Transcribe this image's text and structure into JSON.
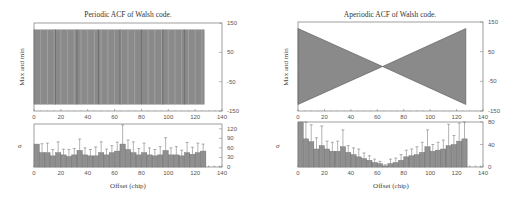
{
  "chart_data": [
    {
      "id": "periodic",
      "type": "bar",
      "title": "Periodic ACF of Walsh code.",
      "panels": [
        {
          "name": "max-min",
          "ylabel": "Max and min",
          "ylim": [
            -150,
            150
          ],
          "yticks": [
            150,
            50,
            -50,
            -150
          ],
          "xlim": [
            0,
            140
          ],
          "xticks": [
            0,
            20,
            40,
            60,
            80,
            100,
            120,
            140
          ],
          "x_range_bars": [
            0,
            127
          ],
          "max_value": 128,
          "min_value": -128,
          "shape": "constant"
        },
        {
          "name": "sigma",
          "ylabel": "σ",
          "xlabel": "Offset (chip)",
          "ylim": [
            0,
            135
          ],
          "yticks": [
            120,
            90,
            60,
            30,
            0
          ],
          "xlim": [
            0,
            140
          ],
          "xticks": [
            0,
            20,
            40,
            60,
            80,
            100,
            120,
            140
          ],
          "x": [
            0,
            4,
            8,
            12,
            16,
            20,
            24,
            28,
            32,
            36,
            40,
            44,
            48,
            52,
            56,
            60,
            64,
            68,
            72,
            76,
            80,
            84,
            88,
            92,
            96,
            100,
            104,
            108,
            112,
            116,
            120,
            124
          ],
          "values": [
            72,
            45,
            45,
            35,
            45,
            38,
            33,
            38,
            52,
            38,
            35,
            35,
            45,
            38,
            45,
            50,
            72,
            55,
            45,
            38,
            45,
            38,
            35,
            38,
            52,
            38,
            38,
            35,
            45,
            40,
            45,
            50
          ],
          "errors": [
            0,
            28,
            30,
            20,
            34,
            18,
            22,
            20,
            36,
            22,
            20,
            28,
            34,
            18,
            22,
            28,
            60,
            30,
            34,
            20,
            30,
            22,
            20,
            26,
            40,
            22,
            26,
            18,
            32,
            22,
            30,
            22
          ]
        }
      ]
    },
    {
      "id": "aperiodic",
      "type": "bar",
      "title": "Aperiodic ACF of Walsh code.",
      "panels": [
        {
          "name": "max-min",
          "ylabel": "Max and min",
          "ylim": [
            -150,
            150
          ],
          "yticks": [
            150,
            50,
            -50,
            -150
          ],
          "xlim": [
            0,
            140
          ],
          "xticks": [
            0,
            20,
            40,
            60,
            80,
            100,
            120,
            140
          ],
          "x_range_bars": [
            0,
            127
          ],
          "max_at_0": 128,
          "crossing_at": 64,
          "max_at_127": 128,
          "shape": "V (hourglass)"
        },
        {
          "name": "sigma",
          "ylabel": "σ",
          "xlabel": "Offset (chip)",
          "ylim": [
            0,
            80
          ],
          "yticks": [
            80,
            40,
            0
          ],
          "xlim": [
            0,
            140
          ],
          "xticks": [
            0,
            20,
            40,
            60,
            80,
            100,
            120,
            140
          ],
          "x": [
            0,
            4,
            8,
            12,
            16,
            20,
            24,
            28,
            32,
            36,
            40,
            44,
            48,
            52,
            56,
            60,
            64,
            68,
            72,
            76,
            80,
            84,
            88,
            92,
            96,
            100,
            104,
            108,
            112,
            116,
            120,
            124
          ],
          "values": [
            80,
            50,
            45,
            32,
            38,
            32,
            28,
            28,
            36,
            26,
            22,
            18,
            15,
            12,
            8,
            6,
            2,
            6,
            8,
            12,
            18,
            20,
            22,
            26,
            36,
            28,
            30,
            32,
            38,
            40,
            46,
            50
          ],
          "errors": [
            0,
            30,
            30,
            20,
            35,
            14,
            16,
            18,
            30,
            12,
            12,
            14,
            10,
            8,
            6,
            4,
            2,
            8,
            8,
            10,
            12,
            12,
            14,
            18,
            30,
            12,
            14,
            16,
            38,
            16,
            32,
            36
          ]
        }
      ]
    }
  ],
  "colors": {
    "bar": "#8a8a8a",
    "bar_dark": "#555555",
    "frame": "#888888",
    "text": "#444444"
  }
}
